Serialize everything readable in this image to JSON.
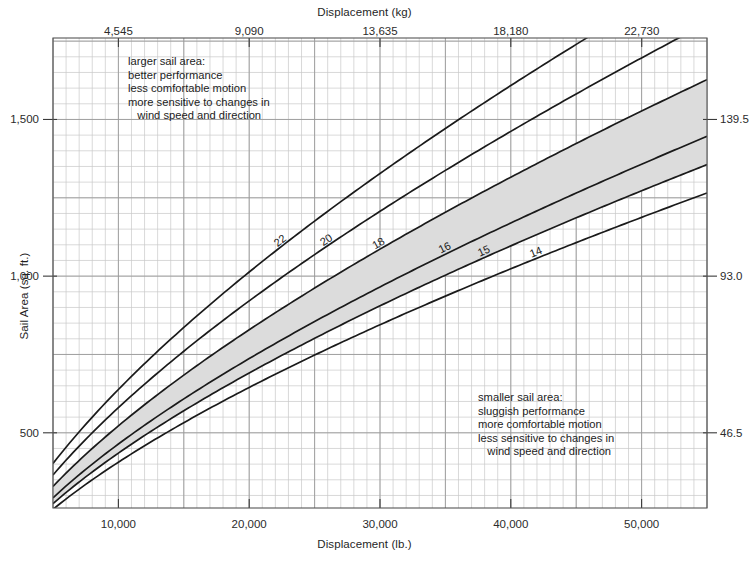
{
  "axes": {
    "top": {
      "title": "Displacement (kg)",
      "ticks": [
        {
          "label": "4,545",
          "value": 4545
        },
        {
          "label": "9,090",
          "value": 9090
        },
        {
          "label": "13,635",
          "value": 13635
        },
        {
          "label": "18,180",
          "value": 18180
        },
        {
          "label": "22,730",
          "value": 22730
        }
      ]
    },
    "bottom": {
      "title": "Displacement (lb.)",
      "ticks": [
        {
          "label": "10,000",
          "value": 10000
        },
        {
          "label": "20,000",
          "value": 20000
        },
        {
          "label": "30,000",
          "value": 30000
        },
        {
          "label": "40,000",
          "value": 40000
        },
        {
          "label": "50,000",
          "value": 50000
        }
      ]
    },
    "left": {
      "title": "Sail Area (sq. ft.)",
      "ticks": [
        {
          "label": "1,500",
          "value": 1500
        },
        {
          "label": "1,000",
          "value": 1000
        },
        {
          "label": "500",
          "value": 500
        }
      ]
    },
    "right": {
      "title": "",
      "ticks": [
        {
          "label": "139.5",
          "value": 1500
        },
        {
          "label": "93.0",
          "value": 1000
        },
        {
          "label": "46.5",
          "value": 500
        }
      ]
    }
  },
  "notes": {
    "upper": "larger sail area:\nbetter performance\nless comfortable motion\nmore sensitive to changes in\n   wind speed and direction",
    "lower": "smaller sail area:\nsluggish performance\nmore comfortable motion\nless sensitive to changes in\n   wind speed and direction"
  },
  "style": {
    "band_fill": "#dcdcdc",
    "grid_minor": "#c9c9c9",
    "grid_major": "#9a9a9a",
    "curve_color": "#1a1a1a",
    "axis_color": "#555555",
    "background": "#ffffff"
  },
  "chart_data": {
    "type": "line",
    "xlabel": "Displacement (lb.)",
    "ylabel": "Sail Area (sq. ft.)",
    "xlim": [
      5000,
      55000
    ],
    "ylim": [
      260,
      1760
    ],
    "grid": true,
    "legend": "none",
    "x_secondary_label": "Displacement (kg)",
    "y_secondary_label": "Sail Area (sq. m.)",
    "x_secondary_factor": 0.4545,
    "y_secondary_factor": 0.0929,
    "shaded_band": {
      "between": [
        "18",
        "15"
      ],
      "fill": "#dcdcdc",
      "meaning": "typical cruising sail area/displacement range"
    },
    "annotations": [
      {
        "position": "upper-left",
        "text": "larger sail area: better performance; less comfortable motion; more sensitive to changes in wind speed and direction"
      },
      {
        "position": "lower-right",
        "text": "smaller sail area: sluggish performance; more comfortable motion; less sensitive to changes in wind speed and direction"
      }
    ],
    "formula": "SailArea = ratio * (Displacement_lb / 64)^(2/3)",
    "series": [
      {
        "name": "22",
        "label": "22",
        "ratio": 22,
        "x": [
          5000,
          10000,
          15000,
          20000,
          25000,
          30000,
          35000,
          40000,
          45000,
          50000,
          55000
        ],
        "values": [
          409,
          649,
          851,
          1031,
          1196,
          1351,
          1497,
          1636,
          1769,
          1898,
          2022
        ]
      },
      {
        "name": "20",
        "label": "20",
        "ratio": 20,
        "x": [
          5000,
          10000,
          15000,
          20000,
          25000,
          30000,
          35000,
          40000,
          45000,
          50000,
          55000
        ],
        "values": [
          372,
          590,
          774,
          937,
          1087,
          1228,
          1361,
          1487,
          1608,
          1725,
          1838
        ]
      },
      {
        "name": "18",
        "label": "18",
        "ratio": 18,
        "x": [
          5000,
          10000,
          15000,
          20000,
          25000,
          30000,
          35000,
          40000,
          45000,
          50000,
          55000
        ],
        "values": [
          335,
          531,
          696,
          844,
          979,
          1105,
          1225,
          1338,
          1447,
          1553,
          1654
        ]
      },
      {
        "name": "16",
        "label": "16",
        "ratio": 16,
        "x": [
          5000,
          10000,
          15000,
          20000,
          25000,
          30000,
          35000,
          40000,
          45000,
          50000,
          55000
        ],
        "values": [
          298,
          472,
          619,
          750,
          870,
          982,
          1089,
          1190,
          1286,
          1380,
          1470
        ]
      },
      {
        "name": "15",
        "label": "15",
        "ratio": 15,
        "x": [
          5000,
          10000,
          15000,
          20000,
          25000,
          30000,
          35000,
          40000,
          45000,
          50000,
          55000
        ],
        "values": [
          279,
          442,
          580,
          703,
          815,
          921,
          1021,
          1115,
          1206,
          1294,
          1378
        ]
      },
      {
        "name": "14",
        "label": "14",
        "ratio": 14,
        "x": [
          5000,
          10000,
          15000,
          20000,
          25000,
          30000,
          35000,
          40000,
          45000,
          50000,
          55000
        ],
        "values": [
          260,
          413,
          541,
          656,
          761,
          860,
          953,
          1041,
          1126,
          1208,
          1286
        ]
      }
    ]
  }
}
